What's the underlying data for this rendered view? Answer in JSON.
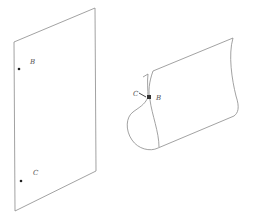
{
  "figure": {
    "flat_sheet": {
      "points": [
        {
          "label": "B",
          "x": 19,
          "y": 69,
          "lx": 30,
          "ly": 64
        },
        {
          "label": "C",
          "x": 21,
          "y": 181,
          "lx": 33,
          "ly": 175
        }
      ]
    },
    "rolled_sheet": {
      "labels": {
        "C": "C",
        "B": "B"
      }
    }
  }
}
